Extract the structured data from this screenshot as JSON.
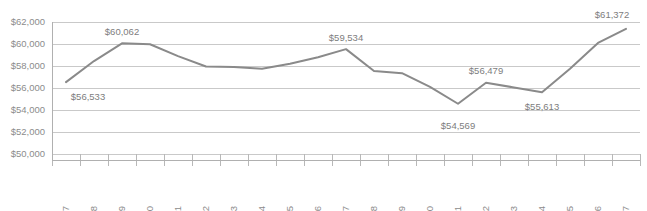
{
  "chart_data": {
    "type": "line",
    "title": "",
    "subtitle": "",
    "xlabel": "",
    "ylabel": "",
    "grid": true,
    "legend": false,
    "legend_position": "none",
    "line_color": "#8a8a8a",
    "text_color": "#8c8c8c",
    "gridline_color": "#c9c9c9",
    "ylim": [
      50000,
      62000
    ],
    "ytick_step": 2000,
    "ytick_labels": [
      "$62,000",
      "$60,000",
      "$58,000",
      "$56,000",
      "$54,000",
      "$52,000",
      "$50,000"
    ],
    "ytick_values": [
      62000,
      60000,
      58000,
      56000,
      54000,
      52000,
      50000
    ],
    "xtick_rotation": -90,
    "categories": [
      "1997",
      "1998",
      "1999",
      "2000",
      "2001",
      "2002",
      "2003",
      "2004",
      "2005",
      "2006",
      "2007",
      "2008",
      "2009",
      "2010",
      "2011",
      "2012",
      "2013",
      "2014",
      "2015",
      "2016",
      "2017"
    ],
    "values": [
      56533,
      58450,
      60062,
      59980,
      58900,
      57950,
      57920,
      57750,
      58200,
      58800,
      59534,
      57550,
      57350,
      56100,
      54569,
      56479,
      56050,
      55613,
      57750,
      60100,
      61372
    ],
    "point_labels": [
      {
        "category": "1997",
        "value": 56533,
        "text": "$56,533",
        "position": "below"
      },
      {
        "category": "1999",
        "value": 60062,
        "text": "$60,062",
        "position": "above"
      },
      {
        "category": "2007",
        "value": 59534,
        "text": "$59,534",
        "position": "above"
      },
      {
        "category": "2011",
        "value": 54569,
        "text": "$54,569",
        "position": "below"
      },
      {
        "category": "2012",
        "value": 56479,
        "text": "$56,479",
        "position": "above"
      },
      {
        "category": "2014",
        "value": 55613,
        "text": "$55,613",
        "position": "below"
      },
      {
        "category": "2017",
        "value": 61372,
        "text": "$61,372",
        "position": "above"
      }
    ]
  }
}
